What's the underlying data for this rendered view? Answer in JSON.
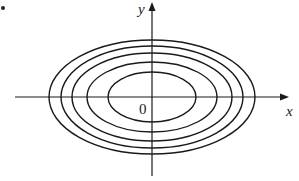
{
  "figure": {
    "bullet": "•",
    "axes": {
      "x_label": "x",
      "y_label": "y",
      "origin_label": "0"
    },
    "contours": [
      {
        "rx": 44,
        "ry": 25
      },
      {
        "rx": 65,
        "ry": 35
      },
      {
        "rx": 80,
        "ry": 44
      },
      {
        "rx": 91,
        "ry": 51
      },
      {
        "rx": 103,
        "ry": 57
      }
    ],
    "stroke_color": "#1a1a1a"
  }
}
